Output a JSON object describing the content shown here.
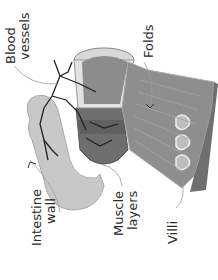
{
  "diagram": {
    "orientation": "rotated-90-ccw",
    "colors": {
      "background": "#ffffff",
      "wall": "#c8c8c8",
      "wall_outline": "#9a9a9a",
      "lumen": "#8c8c8c",
      "muscle": "#6e6e6e",
      "outer_band": "#7a7a7a",
      "vessels": "#222222",
      "leader": "#9a9a9a",
      "text": "#2a2a2a"
    },
    "labels": {
      "blood_vessels": {
        "line1": "Blood",
        "line2": "vessels"
      },
      "folds": {
        "line1": "Folds"
      },
      "intestine_wall": {
        "line1": "Intestine",
        "line2": "wall"
      },
      "muscle_layers": {
        "line1": "Muscle",
        "line2": "layers"
      },
      "villi": {
        "line1": "Villi"
      }
    }
  }
}
